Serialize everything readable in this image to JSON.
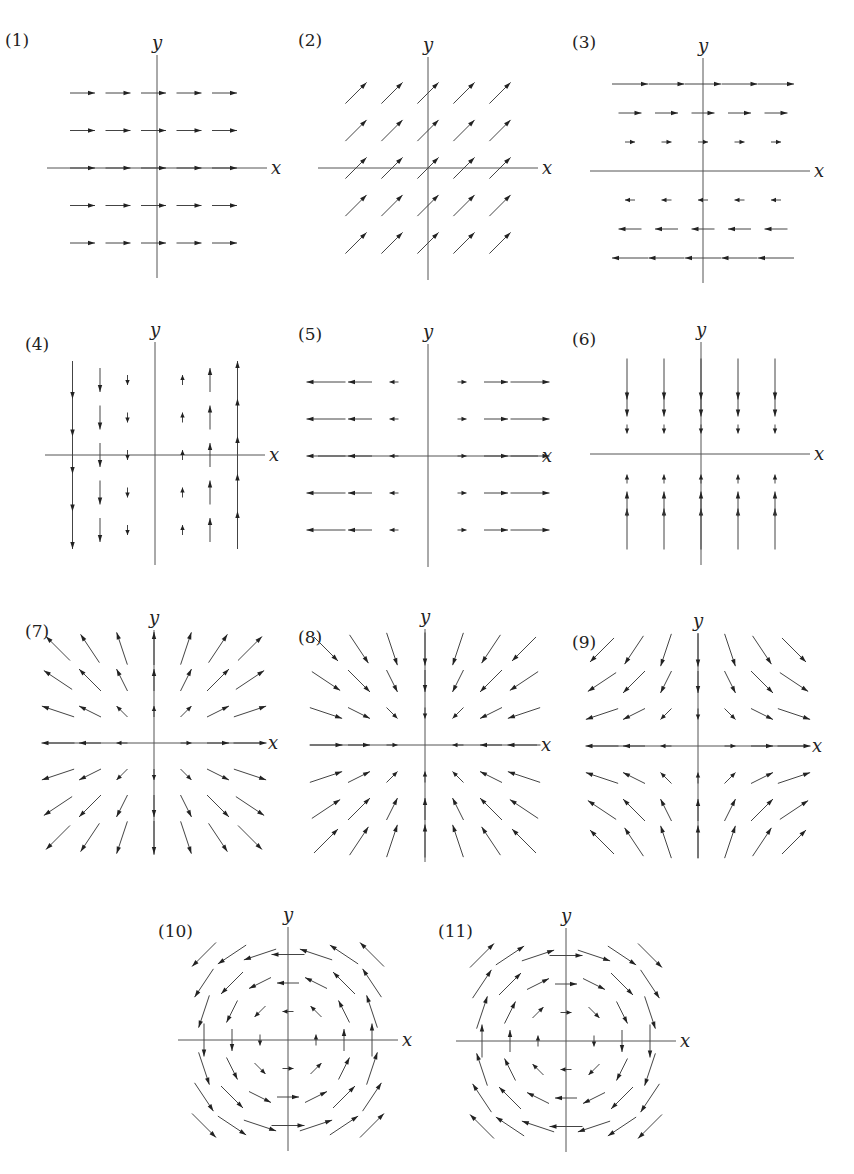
{
  "figure": {
    "axis_labels": {
      "x": "x",
      "y": "y"
    },
    "colors": {
      "arrow": "#444444",
      "arrowhead": "#222222",
      "axis": "#555555",
      "text": "#222222",
      "background": "#ffffff"
    }
  },
  "chart_data": [
    {
      "type": "vector-field",
      "label": "(1)",
      "field": "F = (1, 0)",
      "kind": "constant-x",
      "grid": {
        "cols": [
          -2,
          -1,
          0,
          1,
          2
        ],
        "rows": [
          -2,
          -1,
          0,
          1,
          2
        ]
      },
      "description": "Uniform rightward arrows, equal length"
    },
    {
      "type": "vector-field",
      "label": "(2)",
      "field": "F = (1, 1)",
      "kind": "constant-diag",
      "grid": {
        "cols": [
          -2,
          -1,
          0,
          1,
          2
        ],
        "rows": [
          -2,
          -1,
          0,
          1,
          2
        ]
      },
      "description": "Uniform arrows pointing up-right at 45 degrees"
    },
    {
      "type": "vector-field",
      "label": "(3)",
      "field": "F = (y, 0)",
      "kind": "shear-y",
      "grid": {
        "cols": [
          -2,
          -1,
          0,
          1,
          2
        ],
        "rows": [
          -3,
          -2,
          -1,
          1,
          2,
          3
        ]
      },
      "description": "Rightward above x-axis, leftward below, length grows with |y|"
    },
    {
      "type": "vector-field",
      "label": "(4)",
      "field": "F = (0, x)",
      "kind": "shear-x",
      "grid": {
        "cols": [
          -3,
          -2,
          -1,
          1,
          2,
          3
        ],
        "rows": [
          -2,
          -1,
          0,
          1,
          2
        ]
      },
      "description": "Downward for x<0, upward for x>0, length grows with |x|"
    },
    {
      "type": "vector-field",
      "label": "(5)",
      "field": "F = (x, 0)",
      "kind": "stretch-x",
      "grid": {
        "cols": [
          -3,
          -2,
          -1,
          1,
          2,
          3
        ],
        "rows": [
          -2,
          -1,
          0,
          1,
          2
        ]
      },
      "description": "Arrows point away from y-axis horizontally, length grows with |x|"
    },
    {
      "type": "vector-field",
      "label": "(6)",
      "field": "F = (0, -y)",
      "kind": "compress-y",
      "grid": {
        "cols": [
          -2,
          -1,
          0,
          1,
          2
        ],
        "rows": [
          -3,
          -2,
          -1,
          1,
          2,
          3
        ]
      },
      "description": "Vertical arrows pointing toward x-axis, length grows with |y|"
    },
    {
      "type": "vector-field",
      "label": "(7)",
      "field": "F = (x, y)",
      "kind": "source",
      "grid": {
        "cols": [
          -3,
          -2,
          -1,
          0,
          1,
          2,
          3
        ],
        "rows": [
          -3,
          -2,
          -1,
          0,
          1,
          2,
          3
        ]
      },
      "description": "Radial outward field"
    },
    {
      "type": "vector-field",
      "label": "(8)",
      "field": "F = (-x, -y)",
      "kind": "sink",
      "grid": {
        "cols": [
          -3,
          -2,
          -1,
          0,
          1,
          2,
          3
        ],
        "rows": [
          -3,
          -2,
          -1,
          0,
          1,
          2,
          3
        ]
      },
      "description": "Radial inward field"
    },
    {
      "type": "vector-field",
      "label": "(9)",
      "field": "F = (x, -y)",
      "kind": "saddle",
      "grid": {
        "cols": [
          -3,
          -2,
          -1,
          0,
          1,
          2,
          3
        ],
        "rows": [
          -3,
          -2,
          -1,
          0,
          1,
          2,
          3
        ]
      },
      "description": "Saddle: outward along x, inward along y"
    },
    {
      "type": "vector-field",
      "label": "(10)",
      "field": "F = (-y, x)",
      "kind": "rotation-ccw",
      "grid": {
        "cols": [
          -3,
          -2,
          -1,
          0,
          1,
          2,
          3
        ],
        "rows": [
          -3,
          -2,
          -1,
          0,
          1,
          2,
          3
        ]
      },
      "description": "Counter-clockwise rotation"
    },
    {
      "type": "vector-field",
      "label": "(11)",
      "field": "F = (y, -x)",
      "kind": "rotation-cw",
      "grid": {
        "cols": [
          -3,
          -2,
          -1,
          0,
          1,
          2,
          3
        ],
        "rows": [
          -3,
          -2,
          -1,
          0,
          1,
          2,
          3
        ]
      },
      "description": "Clockwise rotation"
    }
  ]
}
